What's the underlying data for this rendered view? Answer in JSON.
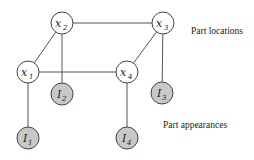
{
  "diagram": {
    "type": "graphical-model",
    "captions": {
      "locations": "Part locations",
      "appearances": "Part appearances"
    },
    "location_nodes": [
      {
        "id": "x1",
        "base": "x",
        "sub": "1",
        "cx": 28,
        "cy": 72
      },
      {
        "id": "x2",
        "base": "x",
        "sub": "2",
        "cx": 62,
        "cy": 23
      },
      {
        "id": "x3",
        "base": "x",
        "sub": "3",
        "cx": 163,
        "cy": 23
      },
      {
        "id": "x4",
        "base": "x",
        "sub": "4",
        "cx": 127,
        "cy": 72
      }
    ],
    "appearance_nodes": [
      {
        "id": "I1",
        "base": "I",
        "sub": "1",
        "cx": 28,
        "cy": 138
      },
      {
        "id": "I2",
        "base": "I",
        "sub": "2",
        "cx": 62,
        "cy": 94
      },
      {
        "id": "I3",
        "base": "I",
        "sub": "3",
        "cx": 162,
        "cy": 93
      },
      {
        "id": "I4",
        "base": "I",
        "sub": "4",
        "cx": 127,
        "cy": 138
      }
    ],
    "edges": [
      [
        "x1",
        "x2"
      ],
      [
        "x2",
        "x3"
      ],
      [
        "x1",
        "x4"
      ],
      [
        "x3",
        "x4"
      ],
      [
        "x1",
        "I1"
      ],
      [
        "x2",
        "I2"
      ],
      [
        "x3",
        "I3"
      ],
      [
        "x4",
        "I4"
      ]
    ],
    "colors": {
      "location_fill": "#ffffff",
      "appearance_fill": "#c8c8c8",
      "stroke": "#444444"
    }
  }
}
